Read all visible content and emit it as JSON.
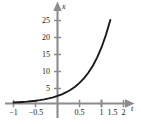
{
  "chart_data": {
    "type": "line",
    "title": "",
    "subtitle": "",
    "xlabel": "t",
    "ylabel": "x",
    "xlim": [
      -1.15,
      2.35
    ],
    "ylim": [
      -1.5,
      27.5
    ],
    "grid": false,
    "legend": null,
    "annotations": [],
    "x_ticks": [
      {
        "value": -1,
        "label": "−1"
      },
      {
        "value": -0.5,
        "label": "−0.5"
      },
      {
        "value": 0.5,
        "label": "0.5"
      },
      {
        "value": 1,
        "label": "1"
      },
      {
        "value": 1.5,
        "label": "1.5"
      },
      {
        "value": 2,
        "label": "2"
      }
    ],
    "y_ticks": [
      {
        "value": 5,
        "label": "5"
      },
      {
        "value": 10,
        "label": "10"
      },
      {
        "value": 15,
        "label": "15"
      },
      {
        "value": 20,
        "label": "20"
      },
      {
        "value": 25,
        "label": "25"
      }
    ],
    "series": [
      {
        "name": "exponential-curve",
        "color": "#1a1a1a",
        "x": [
          -1,
          -0.9,
          -0.8,
          -0.7,
          -0.6,
          -0.5,
          -0.4,
          -0.3,
          -0.2,
          -0.1,
          0,
          0.1,
          0.2,
          0.3,
          0.4,
          0.5,
          0.6,
          0.7,
          0.8,
          0.9,
          1,
          1.1,
          1.2,
          1.3,
          1.4,
          1.5,
          1.6,
          1.7,
          1.8,
          1.9,
          2
        ],
        "y": [
          0.31,
          0.38,
          0.46,
          0.56,
          0.69,
          0.84,
          1.02,
          1.25,
          1.53,
          1.86,
          2.28,
          2.78,
          3.4,
          4.15,
          5.07,
          6.2,
          7.57,
          9.25,
          11.3,
          13.81,
          16.87,
          20.61,
          25.18,
          30.76,
          37.58,
          45.91,
          56.09,
          68.52,
          83.71,
          102.27,
          124.93
        ],
        "y_visible_end": 25.4
      }
    ],
    "colors": {
      "axis": "#8c8c8c",
      "curve": "#1a1a1a",
      "text": "#1a1a1a",
      "background": "#ffffff"
    }
  },
  "labels": {
    "y_axis_name": "x",
    "x_axis_name": "t",
    "y_tick_25": "25",
    "y_tick_20": "20",
    "y_tick_15": "15",
    "y_tick_10": "10",
    "y_tick_5": "5",
    "x_tick_neg1": "−1",
    "x_tick_neg05": "−0.5",
    "x_tick_05": "0.5",
    "x_tick_1": "1",
    "x_tick_15": "1.5",
    "x_tick_2": "2"
  }
}
